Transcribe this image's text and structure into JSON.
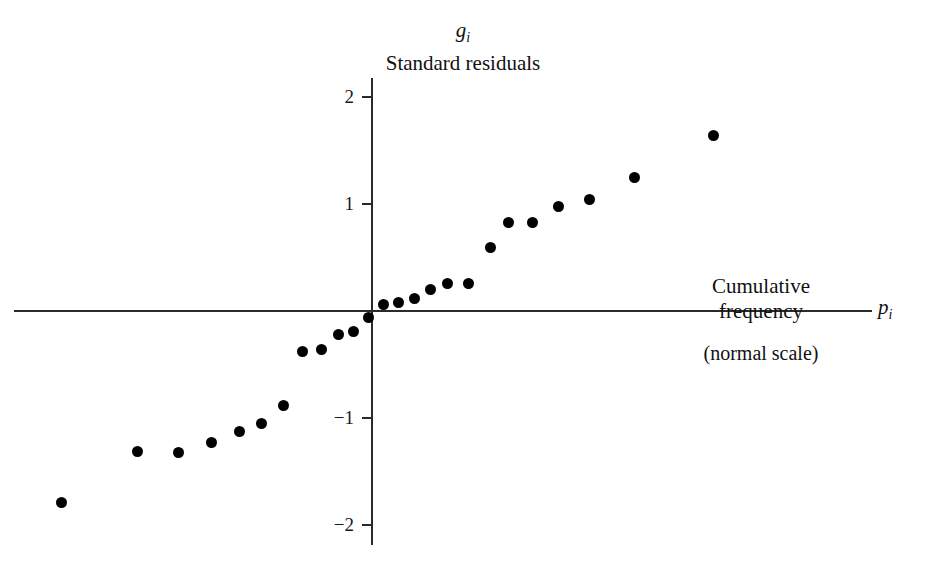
{
  "chart_data": {
    "type": "scatter",
    "title": "",
    "ylabel": "Standard residuals",
    "ylabel_symbol": "g",
    "ylabel_symbol_sub": "i",
    "xlabel": "Cumulative frequency",
    "xlabel_sub": "(normal scale)",
    "xlabel_symbol": "p",
    "xlabel_symbol_sub": "i",
    "grid": false,
    "legend": "none",
    "xlim": [
      -3.35,
      4.68
    ],
    "ylim": [
      -2.18,
      2.18
    ],
    "yticks": [
      2,
      1,
      -1,
      -2
    ],
    "ytick_labels": [
      "2",
      "1",
      "−1",
      "−2"
    ],
    "xticks": [],
    "xtick_labels": [],
    "x": [
      -2.9,
      -2.19,
      -1.81,
      -1.5,
      -1.24,
      -1.03,
      -0.83,
      -0.65,
      -0.47,
      -0.31,
      -0.17,
      -0.03,
      0.11,
      0.25,
      0.4,
      0.55,
      0.71,
      0.9,
      1.11,
      1.28,
      1.5,
      1.74,
      2.03,
      2.45,
      3.19
    ],
    "y": [
      -1.79,
      -1.31,
      -1.32,
      -1.23,
      -1.13,
      -1.05,
      -0.88,
      -0.38,
      -0.36,
      -0.22,
      -0.19,
      -0.06,
      0.06,
      0.08,
      0.12,
      0.2,
      0.26,
      0.26,
      0.59,
      0.83,
      0.83,
      0.98,
      1.04,
      1.25,
      1.64
    ],
    "marker": "filled-circle",
    "marker_color": "#000000",
    "marker_size_px": 11,
    "axis_color": "#2a2a2a"
  }
}
